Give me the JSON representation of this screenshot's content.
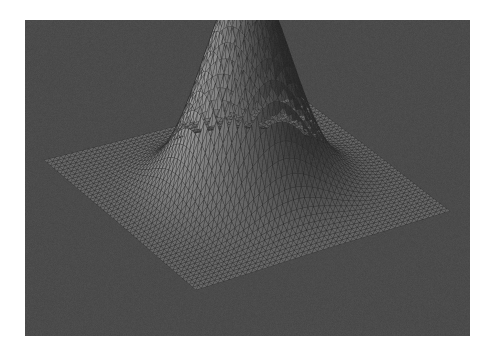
{
  "figure": {
    "type": "surface-plot-3d",
    "background_color": "#ffffff",
    "axes_background_color": "#4b4b4b",
    "axes_rect_px": {
      "x": 25,
      "y": 20,
      "width": 445,
      "height": 316
    },
    "title": "",
    "xlabel": "",
    "ylabel": "",
    "zlabel": "",
    "axis_lines_visible": false,
    "tick_labels_visible": false,
    "grid_visible": false,
    "legend_visible": false,
    "colorbar_visible": false
  },
  "surface": {
    "name": "gaussian-bump-mesh",
    "render_style": "triangular-mesh-shaded",
    "edge_color": "#2a2a2a",
    "edge_width_px": 0.35,
    "shading": "flat-lambertian",
    "colormap": "grayscale",
    "face_color_low": "#1a1a1a",
    "face_color_high": "#c9c9c9",
    "light_direction_label": "front-lower-left",
    "mesh_nu": 46,
    "mesh_nv": 46,
    "plane_level_color": "#ababab",
    "dome_shadow_color": "#151515",
    "dome_highlight_color": "#8d8d8d"
  },
  "projection": {
    "type": "orthographic",
    "azimuth_deg": -60,
    "elevation_deg": 28,
    "corner_left_px": {
      "x": 44,
      "y": 160
    },
    "corner_bottom_px": {
      "x": 196,
      "y": 290
    },
    "corner_right_px": {
      "x": 450,
      "y": 211
    },
    "corner_top_px": {
      "x": 300,
      "y": 96
    },
    "apex_px": {
      "x": 246,
      "y": 88
    }
  },
  "chart_data": {
    "type": "surface",
    "title": "",
    "xlabel": "x",
    "ylabel": "y",
    "zlabel": "z",
    "xlim": [
      -3,
      3
    ],
    "ylim": [
      -3,
      3
    ],
    "zlim": [
      0,
      1
    ],
    "grid": false,
    "legend": false,
    "function": "z = exp(-(x^2 + y^2) / 1.6)",
    "nx": 46,
    "ny": 46,
    "x": [
      -3.0,
      -2.6,
      -2.2,
      -1.8,
      -1.4,
      -1.0,
      -0.6,
      -0.2,
      0.2,
      0.6,
      1.0,
      1.4,
      1.8,
      2.2,
      2.6,
      3.0
    ],
    "y": [
      -3.0,
      -2.6,
      -2.2,
      -1.8,
      -1.4,
      -1.0,
      -0.6,
      -0.2,
      0.2,
      0.6,
      1.0,
      1.4,
      1.8,
      2.2,
      2.6,
      3.0
    ],
    "z": [
      [
        0.0,
        0.0,
        0.0,
        0.0,
        0.0,
        0.0,
        0.0,
        0.0,
        0.0,
        0.0,
        0.0,
        0.0,
        0.0,
        0.0,
        0.0,
        0.0
      ],
      [
        0.0,
        0.0,
        0.0,
        0.0,
        0.0,
        0.01,
        0.01,
        0.01,
        0.01,
        0.01,
        0.01,
        0.0,
        0.0,
        0.0,
        0.0,
        0.0
      ],
      [
        0.0,
        0.0,
        0.0,
        0.0,
        0.01,
        0.02,
        0.03,
        0.04,
        0.04,
        0.03,
        0.02,
        0.01,
        0.0,
        0.0,
        0.0,
        0.0
      ],
      [
        0.0,
        0.0,
        0.0,
        0.01,
        0.03,
        0.06,
        0.1,
        0.12,
        0.12,
        0.1,
        0.06,
        0.03,
        0.01,
        0.0,
        0.0,
        0.0
      ],
      [
        0.0,
        0.0,
        0.01,
        0.03,
        0.08,
        0.17,
        0.27,
        0.33,
        0.33,
        0.27,
        0.17,
        0.08,
        0.03,
        0.01,
        0.0,
        0.0
      ],
      [
        0.0,
        0.01,
        0.02,
        0.06,
        0.17,
        0.34,
        0.54,
        0.65,
        0.65,
        0.54,
        0.34,
        0.17,
        0.06,
        0.02,
        0.01,
        0.0
      ],
      [
        0.0,
        0.01,
        0.03,
        0.1,
        0.27,
        0.54,
        0.85,
        1.0,
        1.0,
        0.85,
        0.54,
        0.27,
        0.1,
        0.03,
        0.01,
        0.0
      ],
      [
        0.0,
        0.01,
        0.04,
        0.12,
        0.33,
        0.65,
        1.0,
        1.0,
        1.0,
        1.0,
        0.65,
        0.33,
        0.12,
        0.04,
        0.01,
        0.0
      ],
      [
        0.0,
        0.01,
        0.04,
        0.12,
        0.33,
        0.65,
        1.0,
        1.0,
        1.0,
        1.0,
        0.65,
        0.33,
        0.12,
        0.04,
        0.01,
        0.0
      ],
      [
        0.0,
        0.01,
        0.03,
        0.1,
        0.27,
        0.54,
        0.85,
        1.0,
        1.0,
        0.85,
        0.54,
        0.27,
        0.1,
        0.03,
        0.01,
        0.0
      ],
      [
        0.0,
        0.01,
        0.02,
        0.06,
        0.17,
        0.34,
        0.54,
        0.65,
        0.65,
        0.54,
        0.34,
        0.17,
        0.06,
        0.02,
        0.01,
        0.0
      ],
      [
        0.0,
        0.0,
        0.01,
        0.03,
        0.08,
        0.17,
        0.27,
        0.33,
        0.33,
        0.27,
        0.17,
        0.08,
        0.03,
        0.01,
        0.0,
        0.0
      ],
      [
        0.0,
        0.0,
        0.0,
        0.01,
        0.03,
        0.06,
        0.1,
        0.12,
        0.12,
        0.1,
        0.06,
        0.03,
        0.01,
        0.0,
        0.0,
        0.0
      ],
      [
        0.0,
        0.0,
        0.0,
        0.0,
        0.01,
        0.02,
        0.03,
        0.04,
        0.04,
        0.03,
        0.02,
        0.01,
        0.0,
        0.0,
        0.0,
        0.0
      ],
      [
        0.0,
        0.0,
        0.0,
        0.0,
        0.0,
        0.01,
        0.01,
        0.01,
        0.01,
        0.01,
        0.01,
        0.0,
        0.0,
        0.0,
        0.0,
        0.0
      ],
      [
        0.0,
        0.0,
        0.0,
        0.0,
        0.0,
        0.0,
        0.0,
        0.0,
        0.0,
        0.0,
        0.0,
        0.0,
        0.0,
        0.0,
        0.0,
        0.0
      ]
    ],
    "annotations": []
  }
}
